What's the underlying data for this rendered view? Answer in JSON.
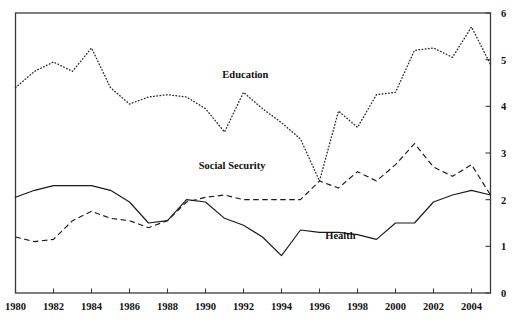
{
  "chart_data": {
    "type": "line",
    "title": "",
    "subtitle": "",
    "xlabel": "",
    "ylabel": "",
    "xlim": [
      1980,
      2005
    ],
    "ylim": [
      0,
      6
    ],
    "grid": false,
    "legend_position": "inline-annotations",
    "x": [
      1980,
      1981,
      1982,
      1983,
      1984,
      1985,
      1986,
      1987,
      1988,
      1989,
      1990,
      1991,
      1992,
      1993,
      1994,
      1995,
      1996,
      1997,
      1998,
      1999,
      2000,
      2001,
      2002,
      2003,
      2004,
      2005
    ],
    "x_tick_labels": [
      "1980",
      "1982",
      "1984",
      "1986",
      "1988",
      "1990",
      "1992",
      "1994",
      "1996",
      "1998",
      "2000",
      "2002",
      "2004"
    ],
    "x_ticks": [
      1980,
      1982,
      1984,
      1986,
      1988,
      1990,
      1992,
      1994,
      1996,
      1998,
      2000,
      2002,
      2004
    ],
    "y_tick_labels": [
      "0",
      "1",
      "2",
      "3",
      "4",
      "5",
      "6"
    ],
    "y_ticks": [
      0,
      1,
      2,
      3,
      4,
      5,
      6
    ],
    "y_axis_side": "right",
    "series": [
      {
        "name": "Education",
        "line_style": "dotted",
        "label_text": "Education",
        "label_x": 1992.1,
        "label_y": 4.6,
        "values": [
          4.4,
          4.75,
          4.95,
          4.75,
          5.25,
          4.4,
          4.05,
          4.2,
          4.25,
          4.2,
          3.95,
          3.45,
          4.3,
          3.95,
          3.65,
          3.3,
          2.4,
          3.9,
          3.55,
          4.25,
          4.3,
          5.2,
          5.25,
          5.05,
          5.7,
          4.9
        ]
      },
      {
        "name": "Social Security",
        "line_style": "dashed",
        "label_text": "Social Security",
        "label_x": 1991.4,
        "label_y": 2.65,
        "values": [
          1.2,
          1.1,
          1.15,
          1.55,
          1.75,
          1.6,
          1.55,
          1.4,
          1.55,
          1.95,
          2.05,
          2.1,
          2.0,
          2.0,
          2.0,
          2.0,
          2.4,
          2.25,
          2.6,
          2.4,
          2.75,
          3.2,
          2.7,
          2.5,
          2.75,
          2.1
        ]
      },
      {
        "name": "Health",
        "line_style": "solid",
        "label_text": "Health",
        "label_x": 1997.1,
        "label_y": 1.15,
        "values": [
          2.05,
          2.2,
          2.3,
          2.3,
          2.3,
          2.2,
          1.95,
          1.5,
          1.55,
          2.0,
          1.95,
          1.6,
          1.45,
          1.2,
          0.8,
          1.35,
          1.3,
          1.3,
          1.25,
          1.15,
          1.5,
          1.5,
          1.95,
          2.1,
          2.2,
          2.1
        ]
      }
    ]
  }
}
